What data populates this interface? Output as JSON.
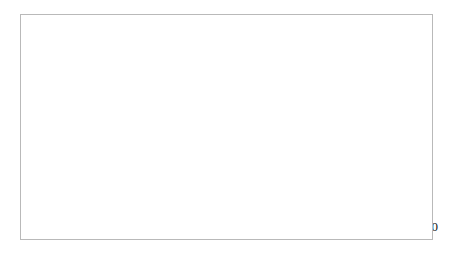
{
  "chart_data": {
    "type": "line",
    "title": "",
    "xlabel": "",
    "ylabel": "",
    "xlim": [
      1965,
      2000
    ],
    "ylim": [
      0,
      35
    ],
    "grid": "horizontal",
    "legend_position": "upper-right-inside",
    "x": [
      1965,
      1974,
      1985,
      1995
    ],
    "xtick_labels": [
      "1971",
      "1980",
      "1990",
      "2000"
    ],
    "xtick_values": [
      1971,
      1980,
      1990,
      2000
    ],
    "ytick_labels": [
      "0%",
      "5%",
      "10%",
      "15%",
      "20%",
      "25%",
      "30%",
      "35%"
    ],
    "ytick_values": [
      0,
      5,
      10,
      15,
      20,
      25,
      30,
      35
    ],
    "series": [
      {
        "name": "Catholics",
        "marker": "diamond",
        "line_width": 1.1,
        "values": [
          19.8,
          20.0,
          23.8,
          29.3
        ]
      },
      {
        "name": "Evangelicals",
        "marker": "circle",
        "line_width": 2.6,
        "values": [
          4.8,
          6.9,
          8.9,
          7.5
        ]
      },
      {
        "name": "Mainline",
        "marker": "triangle",
        "line_width": 1.6,
        "values": [
          6.9,
          5.1,
          3.9,
          3.2
        ]
      }
    ]
  },
  "legend": {
    "entries": [
      {
        "label": "Catholics"
      },
      {
        "label": "Evangelicals"
      },
      {
        "label": "Mainline"
      }
    ]
  },
  "colors": {
    "series": "#000000",
    "grid": "#a9a9a9",
    "axis": "#8f8f8f",
    "frame": "#b9b9b9",
    "background": "#ffffff"
  }
}
